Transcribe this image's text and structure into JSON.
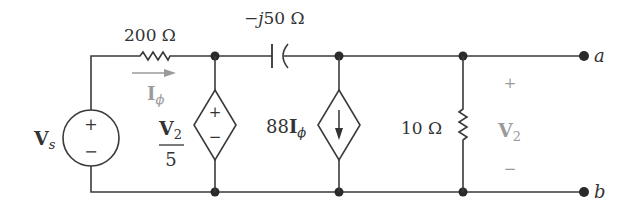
{
  "diagram": {
    "type": "circuit-schematic",
    "source": {
      "label": "V",
      "subscript": "s",
      "plus": "+",
      "minus": "−"
    },
    "resistor_series": {
      "value": "200 Ω"
    },
    "current_label": {
      "symbol": "I",
      "subscript": "ϕ"
    },
    "capacitor": {
      "value": "−j50 Ω",
      "prefix": "−",
      "j": "j",
      "rest": "50 Ω"
    },
    "dependent_voltage_source": {
      "numerator": "V",
      "numerator_sub": "2",
      "denominator": "5",
      "plus": "+",
      "minus": "−"
    },
    "dependent_current_source": {
      "coefficient": "88",
      "symbol": "I",
      "subscript": "ϕ"
    },
    "resistor_shunt": {
      "value": "10 Ω"
    },
    "output_voltage": {
      "symbol": "V",
      "subscript": "2",
      "plus": "+",
      "minus": "−"
    },
    "terminals": {
      "top": "a",
      "bottom": "b"
    }
  }
}
